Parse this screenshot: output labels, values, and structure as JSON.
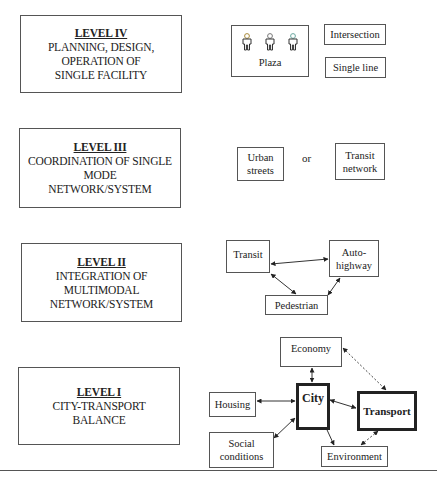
{
  "levels": [
    {
      "id": "level-iv",
      "title": "LEVEL IV",
      "lines": [
        "PLANNING, DESIGN,",
        "OPERATION OF",
        "SINGLE FACILITY"
      ],
      "nodes": {
        "plaza": "Plaza",
        "intersection": "Intersection",
        "single_line": "Single line"
      },
      "icons": [
        "person-icon",
        "person-icon",
        "person-icon"
      ]
    },
    {
      "id": "level-iii",
      "title": "LEVEL III",
      "lines": [
        "COORDINATION OF SINGLE",
        "MODE",
        "NETWORK/SYSTEM"
      ],
      "nodes": {
        "urban_streets": [
          "Urban",
          "streets"
        ],
        "connector": "or",
        "transit_network": [
          "Transit",
          "network"
        ]
      }
    },
    {
      "id": "level-ii",
      "title": "LEVEL II",
      "lines": [
        "INTEGRATION OF",
        "MULTIMODAL",
        "NETWORK/SYSTEM"
      ],
      "nodes": {
        "transit": "Transit",
        "auto_highway": [
          "Auto-",
          "highway"
        ],
        "pedestrian": "Pedestrian"
      },
      "links": [
        {
          "from": "Transit",
          "to": "Auto-highway",
          "style": "solid",
          "bidirectional": true
        },
        {
          "from": "Transit",
          "to": "Pedestrian",
          "style": "solid",
          "bidirectional": true
        },
        {
          "from": "Auto-highway",
          "to": "Pedestrian",
          "style": "solid",
          "bidirectional": true
        }
      ]
    },
    {
      "id": "level-i",
      "title": "LEVEL I",
      "lines": [
        "CITY-TRANSPORT",
        "BALANCE"
      ],
      "nodes": {
        "economy": "Economy",
        "city": "City",
        "transport": "Transport",
        "housing": "Housing",
        "social_conditions": [
          "Social",
          "conditions"
        ],
        "environment": "Environment"
      },
      "links": [
        {
          "from": "City",
          "to": "Economy",
          "style": "solid",
          "bidirectional": true
        },
        {
          "from": "City",
          "to": "Housing",
          "style": "solid",
          "bidirectional": true
        },
        {
          "from": "City",
          "to": "Transport",
          "style": "solid",
          "bidirectional": true
        },
        {
          "from": "City",
          "to": "Social conditions",
          "style": "solid",
          "bidirectional": true
        },
        {
          "from": "City",
          "to": "Environment",
          "style": "solid",
          "bidirectional": true
        },
        {
          "from": "Economy",
          "to": "Transport",
          "style": "dashed",
          "bidirectional": true
        },
        {
          "from": "Transport",
          "to": "Environment",
          "style": "dashed",
          "bidirectional": true
        }
      ]
    }
  ],
  "colors": {
    "border": "#555555",
    "thick_border": "#222222",
    "text": "#222222",
    "background": "#ffffff"
  }
}
